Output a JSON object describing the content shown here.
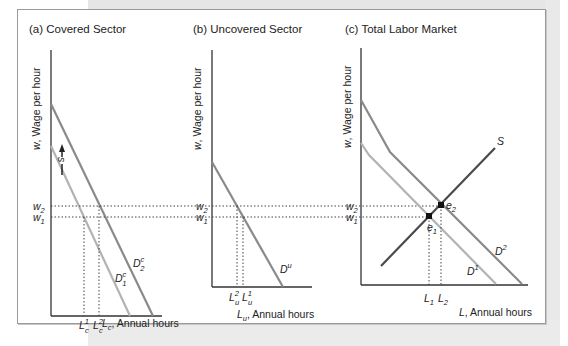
{
  "panels": [
    {
      "title": "(a) Covered Sector",
      "ylabel": "w, Wage per hour",
      "xlabel_var": "L",
      "xlabel_sub": "c",
      "xlabel_rest": ", Annual hours",
      "curves": [
        {
          "label": "D",
          "sub": "1",
          "sup": "c",
          "color": "#b3b3b3"
        },
        {
          "label": "D",
          "sub": "2",
          "sup": "c",
          "color": "#8a8a8a"
        }
      ],
      "shift_label": "s",
      "ticks_x": [
        {
          "var": "L",
          "sub": "c",
          "sup": "1"
        },
        {
          "var": "L",
          "sub": "c",
          "sup": "2"
        }
      ]
    },
    {
      "title": "(b) Uncovered Sector",
      "ylabel": "w, Wage per hour",
      "xlabel_var": "L",
      "xlabel_sub": "u",
      "xlabel_rest": ", Annual hours",
      "curves": [
        {
          "label": "D",
          "sup": "u",
          "color": "#8a8a8a"
        }
      ],
      "ticks_x": [
        {
          "var": "L",
          "sub": "u",
          "sup": "2"
        },
        {
          "var": "L",
          "sub": "u",
          "sup": "1"
        }
      ]
    },
    {
      "title": "(c) Total Labor Market",
      "ylabel": "w, Wage per hour",
      "xlabel_var": "L",
      "xlabel_rest": ", Annual hours",
      "curves": [
        {
          "label": "D",
          "sup": "1",
          "color": "#b3b3b3"
        },
        {
          "label": "D",
          "sup": "2",
          "color": "#8a8a8a"
        },
        {
          "label": "S",
          "color": "#4a4a4a"
        }
      ],
      "points": [
        {
          "label": "e",
          "sub": "1"
        },
        {
          "label": "e",
          "sub": "2"
        }
      ],
      "ticks_x": [
        {
          "var": "L",
          "sub": "1"
        },
        {
          "var": "L",
          "sub": "2"
        }
      ]
    }
  ],
  "wage_levels": [
    {
      "var": "w",
      "sub": "2"
    },
    {
      "var": "w",
      "sub": "1"
    }
  ]
}
